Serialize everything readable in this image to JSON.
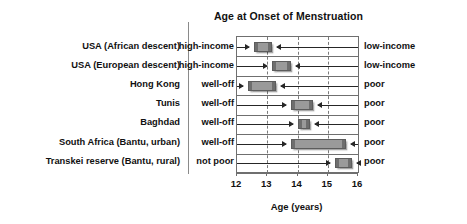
{
  "chart_data": {
    "type": "bar",
    "title": "Age at Onset of Menstruation",
    "xlabel": "Age (years)",
    "ylabel": "",
    "xlim": [
      12,
      16
    ],
    "xticks": [
      12,
      13,
      14,
      15,
      16
    ],
    "xticklabels": [
      "12",
      "13",
      "14",
      "15",
      "16"
    ],
    "grid": "vertical-dashed",
    "legend": "none",
    "orientation": "horizontal",
    "bar_style": "range-bars (low end to high end) with inward arrows",
    "categories": [
      "USA (African descent)",
      "USA (European descent)",
      "Hong Kong",
      "Tunis",
      "Baghdad",
      "South Africa (Bantu, urban)",
      "Transkei reserve (Bantu, rural)"
    ],
    "left_group_labels": [
      "high-income",
      "high-income",
      "well-off",
      "well-off",
      "well-off",
      "well-off",
      "not poor"
    ],
    "right_group_labels": [
      "low-income",
      "low-income",
      "poor",
      "poor",
      "poor",
      "poor",
      "poor"
    ],
    "rows": [
      {
        "category": "USA (African descent)",
        "left_label": "high-income",
        "right_label": "low-income",
        "start": 12.55,
        "end": 13.15
      },
      {
        "category": "USA (European descent)",
        "left_label": "high-income",
        "right_label": "low-income",
        "start": 13.15,
        "end": 13.8
      },
      {
        "category": "Hong Kong",
        "left_label": "well-off",
        "right_label": "poor",
        "start": 12.35,
        "end": 13.3
      },
      {
        "category": "Tunis",
        "left_label": "well-off",
        "right_label": "poor",
        "start": 13.8,
        "end": 14.5
      },
      {
        "category": "Baghdad",
        "left_label": "well-off",
        "right_label": "poor",
        "start": 14.0,
        "end": 14.4
      },
      {
        "category": "South Africa (Bantu, urban)",
        "left_label": "well-off",
        "right_label": "poor",
        "start": 13.8,
        "end": 15.6
      },
      {
        "category": "Transkei reserve (Bantu, rural)",
        "left_label": "not poor",
        "right_label": "poor",
        "start": 15.25,
        "end": 15.8
      }
    ],
    "colors": {
      "bar_fill": "#9a9a9a",
      "bar_edge": "#5c5c5c",
      "bar_cap": "#6e6e6e",
      "axis": "#6f6f6f",
      "grid": "#7a7a7a",
      "text": "#111111",
      "background": "#ffffff"
    }
  }
}
